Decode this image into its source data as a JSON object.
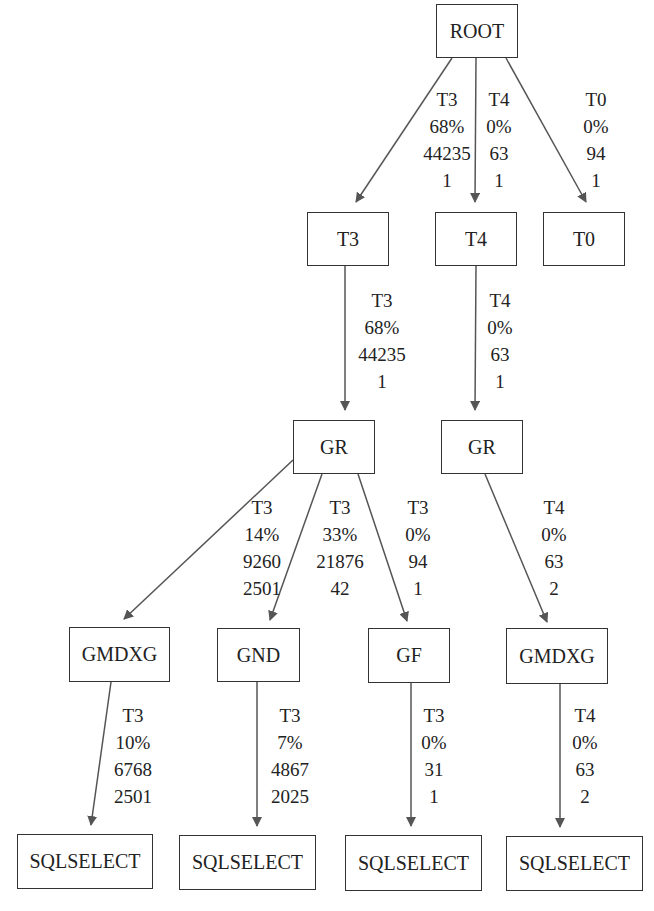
{
  "diagram": {
    "type": "tree",
    "nodes": [
      {
        "id": "root",
        "label": "ROOT",
        "x": 436,
        "y": 4,
        "w": 82,
        "h": 54
      },
      {
        "id": "t3",
        "label": "T3",
        "x": 307,
        "y": 212,
        "w": 82,
        "h": 54
      },
      {
        "id": "t4",
        "label": "T4",
        "x": 435,
        "y": 212,
        "w": 82,
        "h": 54
      },
      {
        "id": "t0",
        "label": "T0",
        "x": 543,
        "y": 212,
        "w": 82,
        "h": 54
      },
      {
        "id": "gr1",
        "label": "GR",
        "x": 293,
        "y": 420,
        "w": 82,
        "h": 54
      },
      {
        "id": "gr2",
        "label": "GR",
        "x": 441,
        "y": 420,
        "w": 82,
        "h": 54
      },
      {
        "id": "gmdxg1",
        "label": "GMDXG",
        "x": 69,
        "y": 627,
        "w": 101,
        "h": 55
      },
      {
        "id": "gnd",
        "label": "GND",
        "x": 217,
        "y": 628,
        "w": 83,
        "h": 54
      },
      {
        "id": "gf",
        "label": "GF",
        "x": 368,
        "y": 628,
        "w": 82,
        "h": 55
      },
      {
        "id": "gmdxg2",
        "label": "GMDXG",
        "x": 506,
        "y": 628,
        "w": 102,
        "h": 56
      },
      {
        "id": "sql1",
        "label": "SQLSELECT",
        "x": 17,
        "y": 834,
        "w": 136,
        "h": 55
      },
      {
        "id": "sql2",
        "label": "SQLSELECT",
        "x": 179,
        "y": 835,
        "w": 137,
        "h": 55
      },
      {
        "id": "sql3",
        "label": "SQLSELECT",
        "x": 345,
        "y": 835,
        "w": 137,
        "h": 56
      },
      {
        "id": "sql4",
        "label": "SQLSELECT",
        "x": 506,
        "y": 836,
        "w": 137,
        "h": 55
      }
    ],
    "edges": [
      {
        "from": "root",
        "to": "t3",
        "x1": 452,
        "y1": 58,
        "x2": 356,
        "y2": 202,
        "lines": [
          "T3",
          "68%",
          "44235",
          "1"
        ],
        "lx": 447,
        "ly": 86
      },
      {
        "from": "root",
        "to": "t4",
        "x1": 476,
        "y1": 58,
        "x2": 475,
        "y2": 202,
        "lines": [
          "T4",
          "0%",
          "63",
          "1"
        ],
        "lx": 499,
        "ly": 86
      },
      {
        "from": "root",
        "to": "t0",
        "x1": 506,
        "y1": 58,
        "x2": 586,
        "y2": 202,
        "lines": [
          "T0",
          "0%",
          "94",
          "1"
        ],
        "lx": 596,
        "ly": 86
      },
      {
        "from": "t3",
        "to": "gr1",
        "x1": 345,
        "y1": 266,
        "x2": 345,
        "y2": 410,
        "lines": [
          "T3",
          "68%",
          "44235",
          "1"
        ],
        "lx": 382,
        "ly": 287
      },
      {
        "from": "t4",
        "to": "gr2",
        "x1": 476,
        "y1": 266,
        "x2": 475,
        "y2": 410,
        "lines": [
          "T4",
          "0%",
          "63",
          "1"
        ],
        "lx": 500,
        "ly": 287
      },
      {
        "from": "gr1",
        "to": "gmdxg1",
        "x1": 293,
        "y1": 460,
        "x2": 124,
        "y2": 619,
        "lines": [
          "T3",
          "14%",
          "9260",
          "2501"
        ],
        "lx": 262,
        "ly": 494
      },
      {
        "from": "gr1",
        "to": "gnd",
        "x1": 322,
        "y1": 474,
        "x2": 270,
        "y2": 620,
        "lines": [
          "T3",
          "33%",
          "21876",
          "42"
        ],
        "lx": 340,
        "ly": 494
      },
      {
        "from": "gr1",
        "to": "gf",
        "x1": 358,
        "y1": 474,
        "x2": 407,
        "y2": 621,
        "lines": [
          "T3",
          "0%",
          "94",
          "1"
        ],
        "lx": 418,
        "ly": 494
      },
      {
        "from": "gr2",
        "to": "gmdxg2",
        "x1": 485,
        "y1": 474,
        "x2": 547,
        "y2": 622,
        "lines": [
          "T4",
          "0%",
          "63",
          "2"
        ],
        "lx": 554,
        "ly": 494
      },
      {
        "from": "gmdxg1",
        "to": "sql1",
        "x1": 111,
        "y1": 682,
        "x2": 91,
        "y2": 825,
        "lines": [
          "T3",
          "10%",
          "6768",
          "2501"
        ],
        "lx": 133,
        "ly": 702
      },
      {
        "from": "gnd",
        "to": "sql2",
        "x1": 257,
        "y1": 682,
        "x2": 257,
        "y2": 826,
        "lines": [
          "T3",
          "7%",
          "4867",
          "2025"
        ],
        "lx": 290,
        "ly": 702
      },
      {
        "from": "gf",
        "to": "sql3",
        "x1": 411,
        "y1": 683,
        "x2": 411,
        "y2": 826,
        "lines": [
          "T3",
          "0%",
          "31",
          "1"
        ],
        "lx": 434,
        "ly": 702
      },
      {
        "from": "gmdxg2",
        "to": "sql4",
        "x1": 560,
        "y1": 684,
        "x2": 560,
        "y2": 827,
        "lines": [
          "T4",
          "0%",
          "63",
          "2"
        ],
        "lx": 585,
        "ly": 702
      }
    ],
    "colors": {
      "edge": "#555555",
      "border": "#333333",
      "text": "#222222"
    }
  }
}
